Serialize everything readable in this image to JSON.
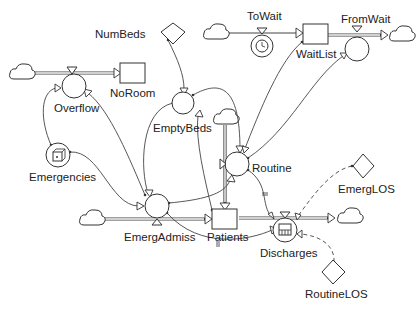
{
  "diagram": {
    "type": "stock-and-flow",
    "stocks": {
      "noroom": "NoRoom",
      "waitlist": "WaitList",
      "patients": "Patients"
    },
    "flows": {
      "overflow": "Overflow",
      "towait": "ToWait",
      "fromwait": "FromWait",
      "routine": "Routine",
      "emergadmiss": "EmergAdmiss",
      "discharges": "Discharges"
    },
    "auxiliaries": {
      "emptybeds": "EmptyBeds",
      "emergencies": "Emergencies"
    },
    "constants": {
      "numbeds": "NumBeds",
      "emerglos": "EmergLOS",
      "routinelos": "RoutineLOS"
    },
    "connections": [
      {
        "from": "NumBeds",
        "to": "EmptyBeds"
      },
      {
        "from": "Patients",
        "to": "EmptyBeds"
      },
      {
        "from": "EmptyBeds",
        "to": "EmergAdmiss"
      },
      {
        "from": "EmptyBeds",
        "to": "Routine"
      },
      {
        "from": "Emergencies",
        "to": "Overflow"
      },
      {
        "from": "Emergencies",
        "to": "EmergAdmiss"
      },
      {
        "from": "EmergAdmiss",
        "to": "Overflow"
      },
      {
        "from": "EmergAdmiss",
        "to": "Routine"
      },
      {
        "from": "EmergAdmiss",
        "to": "Discharges",
        "delay": true
      },
      {
        "from": "WaitList",
        "to": "Routine"
      },
      {
        "from": "Routine",
        "to": "FromWait"
      },
      {
        "from": "Routine",
        "to": "Discharges",
        "delay": true
      },
      {
        "from": "EmergLOS",
        "to": "Discharges",
        "style": "dashed"
      },
      {
        "from": "RoutineLOS",
        "to": "Discharges",
        "style": "dashed"
      }
    ]
  }
}
